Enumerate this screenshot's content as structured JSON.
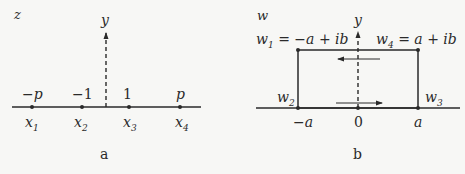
{
  "panel_a": {
    "plane_label": "z",
    "axis_label": "y",
    "caption": "a",
    "points": [
      {
        "top": "−p",
        "bottom": "x",
        "sub": "1"
      },
      {
        "top": "−1",
        "bottom": "x",
        "sub": "2"
      },
      {
        "top": "1",
        "bottom": "x",
        "sub": "3"
      },
      {
        "top": "p",
        "bottom": "x",
        "sub": "4"
      }
    ]
  },
  "panel_b": {
    "plane_label": "w",
    "axis_label": "y",
    "caption": "b",
    "w1": {
      "name": "w",
      "sub": "1",
      "value": " = −a + ib"
    },
    "w4": {
      "name": "w",
      "sub": "4",
      "value": " = a + ib"
    },
    "w2": {
      "name": "w",
      "sub": "2"
    },
    "w3": {
      "name": "w",
      "sub": "3"
    },
    "axis_ticks": [
      "−a",
      "0",
      "a"
    ]
  },
  "colors": {
    "ink": "#2a2a2a",
    "background": "#f7f7f5"
  }
}
